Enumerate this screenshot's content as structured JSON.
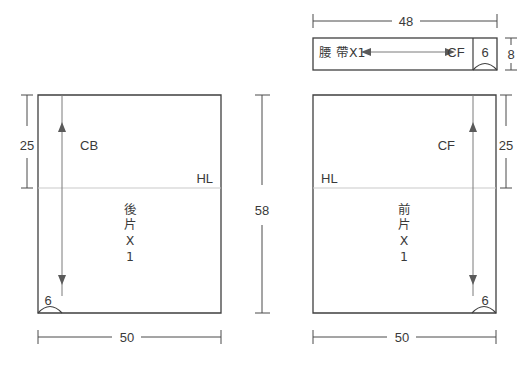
{
  "sheet": {
    "title": "Sewing pattern layout diagram",
    "background_color": "#ffffff",
    "line_color": "#3f3f3f",
    "guide_color": "#c9c9c9",
    "width": 531,
    "height": 371
  },
  "waistband": {
    "name": "waistband-piece",
    "label": "腰 帶X1",
    "center_front_label": "CF",
    "end_segment_label": "6",
    "width_dimension": "48",
    "height_dimension": "8"
  },
  "back_piece": {
    "name": "back-piece",
    "label_lines": [
      "後",
      "片",
      "X",
      "1"
    ],
    "label": "後片X1",
    "center_back_label": "CB",
    "hip_line_label": "HL",
    "top_dimension": "25",
    "bottom_dimension": "50",
    "corner_curve_label": "6"
  },
  "front_piece": {
    "name": "front-piece",
    "label_lines": [
      "前",
      "片",
      "X",
      "1"
    ],
    "label": "前片X1",
    "center_front_label": "CF",
    "hip_line_label": "HL",
    "side_dimension": "25",
    "bottom_dimension": "50",
    "corner_curve_label": "6"
  },
  "overall": {
    "height_dimension": "58"
  }
}
